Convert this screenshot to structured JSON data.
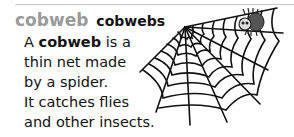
{
  "entry": {
    "headword": "cobweb",
    "plural": "cobwebs",
    "definition_lines": [
      {
        "pre": "A ",
        "bold": "cobweb",
        "post": " is a"
      },
      {
        "text": "thin net made"
      },
      {
        "text": "by a spider."
      },
      {
        "text": "It catches flies"
      },
      {
        "text": "and other insects."
      }
    ]
  },
  "illustration": {
    "subject": "spider-web-with-spider-icon",
    "line_color": "#111111",
    "spider_color": "#555555"
  }
}
